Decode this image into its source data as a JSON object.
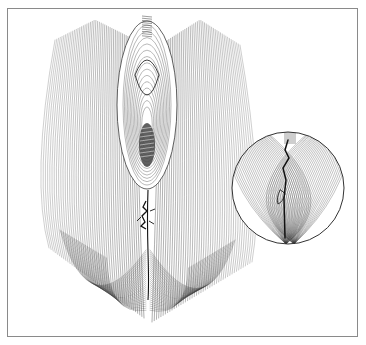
{
  "figure": {
    "type": "anatomical line illustration",
    "caption": "",
    "colors": {
      "background": "#ffffff",
      "frame": "#8a8a8a",
      "line": "#3a3a3a",
      "dark": "#111111"
    },
    "frame": {
      "x": 7,
      "y": 8,
      "width": 351,
      "height": 329
    },
    "main_drawing": {
      "center_x": 148,
      "opening": {
        "cx": 147,
        "cy": 105,
        "rx": 24,
        "ry": 80
      },
      "lower_detail": {
        "cx": 146,
        "cy": 215
      },
      "cleft": {
        "x": 148,
        "y_top": 190,
        "y_bottom": 300
      },
      "left_lobe_bottom": 318,
      "right_lobe_bottom": 322
    },
    "inset": {
      "shape": "circle",
      "cx": 288,
      "cy": 188,
      "r": 56,
      "detail_x": 290
    }
  }
}
